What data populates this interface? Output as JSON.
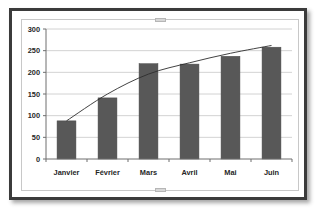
{
  "window": {
    "object_name": "chart-object",
    "selected": true,
    "handles": [
      "top-center-handle",
      "bottom-center-handle"
    ]
  },
  "colors": {
    "bar_fill": "#585858",
    "bar_stroke": "#4a4a4a",
    "trendline": "#2e2e2e",
    "gridline": "#c6c6c6",
    "axis": "#6f6f6f",
    "plot_background": "#ffffff",
    "object_border": "#3b3b3b",
    "selection_frame": "#c8c8c8",
    "tick_text": "#262626"
  },
  "chart_data": {
    "type": "bar",
    "title": "",
    "subtitle": "",
    "xlabel": "",
    "ylabel": "",
    "categories": [
      "Janvier",
      "Février",
      "Mars",
      "Avril",
      "Mai",
      "Juin"
    ],
    "values": [
      88,
      141,
      220,
      219,
      237,
      258
    ],
    "series": [
      {
        "name": "Série 1",
        "type": "bar",
        "values": [
          88,
          141,
          220,
          219,
          237,
          258
        ]
      },
      {
        "name": "Courbe de tendance",
        "type": "line",
        "values": [
          88,
          150,
          196,
          222,
          244,
          262
        ]
      }
    ],
    "ylim": [
      0,
      300
    ],
    "ytick_values": [
      0,
      50,
      100,
      150,
      200,
      250,
      300
    ],
    "ytick_labels": [
      "0",
      "50",
      "100",
      "150",
      "200",
      "250",
      "300"
    ],
    "xtick_labels": [
      "Janvier",
      "Février",
      "Mars",
      "Avril",
      "Mai",
      "Juin"
    ],
    "grid": true,
    "grid_axis": "y",
    "legend": false,
    "legend_position": "none",
    "annotations": []
  }
}
